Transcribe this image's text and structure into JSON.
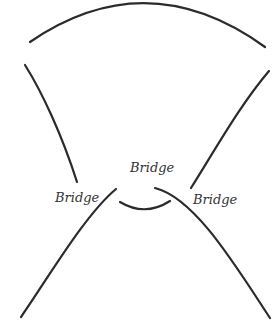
{
  "diagram": {
    "type": "knot-diagram",
    "stroke_color": "#2b2b2b",
    "background": "#ffffff",
    "labels": {
      "center": "Bridge",
      "left": "Bridge",
      "right": "Bridge"
    },
    "strands": [
      {
        "name": "top-arc",
        "path": "M30,42 Q147,-38 265,47"
      },
      {
        "name": "left-upper-strand",
        "path": "M25,65 C42,92 62,135 77,182"
      },
      {
        "name": "right-upper-strand",
        "path": "M269,71 C240,105 215,150 191,188"
      },
      {
        "name": "left-lower-strand",
        "path": "M21,317 C50,275 85,215 116,189"
      },
      {
        "name": "right-lower-strand",
        "path": "M155,188 C195,198 235,265 270,318"
      },
      {
        "name": "bottom-small-arc",
        "path": "M120,202 Q145,217 170,201"
      }
    ]
  }
}
